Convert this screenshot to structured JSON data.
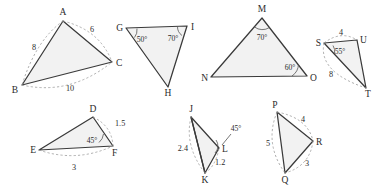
{
  "figure": {
    "background_color": "#ffffff",
    "stroke_color": "#3a3a3a",
    "fill_color": "#f2f2f2",
    "arc_color": "#9a9a9a"
  },
  "triangles": [
    {
      "id": "ABC",
      "vertices": [
        {
          "label": "A",
          "x": 63,
          "y": 21
        },
        {
          "label": "B",
          "x": 22,
          "y": 85
        },
        {
          "label": "C",
          "x": 112,
          "y": 62
        }
      ],
      "measures": [
        {
          "text": "8",
          "x": 34,
          "y": 50
        },
        {
          "text": "6",
          "x": 92,
          "y": 32
        },
        {
          "text": "10",
          "x": 70,
          "y": 89
        }
      ],
      "angles": []
    },
    {
      "id": "GHI",
      "vertices": [
        {
          "label": "G",
          "x": 126,
          "y": 28
        },
        {
          "label": "H",
          "x": 168,
          "y": 87
        },
        {
          "label": "I",
          "x": 187,
          "y": 26
        }
      ],
      "measures": [],
      "angles": [
        {
          "text": "50°",
          "x": 142,
          "y": 41
        },
        {
          "text": "70°",
          "x": 172,
          "y": 40
        }
      ]
    },
    {
      "id": "MNO",
      "vertices": [
        {
          "label": "M",
          "x": 262,
          "y": 18
        },
        {
          "label": "N",
          "x": 211,
          "y": 77
        },
        {
          "label": "O",
          "x": 307,
          "y": 76
        }
      ],
      "measures": [],
      "angles": [
        {
          "text": "70°",
          "x": 262,
          "y": 39
        },
        {
          "text": "60°",
          "x": 288,
          "y": 69
        }
      ]
    },
    {
      "id": "STU",
      "vertices": [
        {
          "label": "S",
          "x": 324,
          "y": 43
        },
        {
          "label": "T",
          "x": 366,
          "y": 88
        },
        {
          "label": "U",
          "x": 357,
          "y": 40
        }
      ],
      "measures": [
        {
          "text": "4",
          "x": 341,
          "y": 34
        },
        {
          "text": "8",
          "x": 332,
          "y": 75
        }
      ],
      "angles": [
        {
          "text": "55°",
          "x": 339,
          "y": 52
        }
      ]
    },
    {
      "id": "DEF",
      "vertices": [
        {
          "label": "D",
          "x": 93,
          "y": 117
        },
        {
          "label": "E",
          "x": 39,
          "y": 150
        },
        {
          "label": "F",
          "x": 113,
          "y": 146
        }
      ],
      "measures": [
        {
          "text": "1.5",
          "x": 114,
          "y": 124
        },
        {
          "text": "3",
          "x": 74,
          "y": 168
        }
      ],
      "angles": [
        {
          "text": "45°",
          "x": 92,
          "y": 142
        }
      ]
    },
    {
      "id": "JKL",
      "vertices": [
        {
          "label": "J",
          "x": 191,
          "y": 117
        },
        {
          "label": "K",
          "x": 205,
          "y": 173
        },
        {
          "label": "L",
          "x": 219,
          "y": 148
        }
      ],
      "measures": [
        {
          "text": "2.4",
          "x": 180,
          "y": 148
        },
        {
          "text": "1.2",
          "x": 221,
          "y": 162
        }
      ],
      "angles": [
        {
          "text": "45°",
          "x": 233,
          "y": 131
        }
      ]
    },
    {
      "id": "PQR",
      "vertices": [
        {
          "label": "P",
          "x": 277,
          "y": 112
        },
        {
          "label": "Q",
          "x": 285,
          "y": 173
        },
        {
          "label": "R",
          "x": 313,
          "y": 141
        }
      ],
      "measures": [
        {
          "text": "4",
          "x": 305,
          "y": 120
        },
        {
          "text": "5",
          "x": 268,
          "y": 143
        },
        {
          "text": "3",
          "x": 308,
          "y": 163
        }
      ],
      "angles": []
    }
  ],
  "vertex_labels": {
    "A": "A",
    "B": "B",
    "C": "C",
    "D": "D",
    "E": "E",
    "F": "F",
    "G": "G",
    "H": "H",
    "I": "I",
    "J": "J",
    "K": "K",
    "L": "L",
    "M": "M",
    "N": "N",
    "O": "O",
    "P": "P",
    "Q": "Q",
    "R": "R",
    "S": "S",
    "T": "T",
    "U": "U"
  }
}
